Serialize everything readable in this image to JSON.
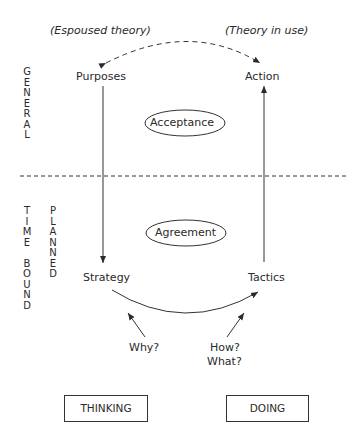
{
  "diagram": {
    "top_labels": {
      "left": "(Espoused theory)",
      "right": "(Theory in use)"
    },
    "nodes": {
      "purposes": "Purposes",
      "action": "Action",
      "strategy": "Strategy",
      "tactics": "Tactics"
    },
    "ellipses": {
      "upper": "Acceptance",
      "lower": "Agreement"
    },
    "questions": {
      "why": "Why?",
      "how": "How?",
      "what": "What?"
    },
    "side_labels": {
      "general": [
        "G",
        "E",
        "N",
        "E",
        "R",
        "A",
        "L"
      ],
      "time_bound": [
        "T",
        "I",
        "M",
        "E",
        " ",
        "B",
        "O",
        "U",
        "N",
        "D"
      ],
      "planned": [
        "P",
        "L",
        "A",
        "N",
        "N",
        "E",
        "D"
      ]
    },
    "boxes": {
      "thinking": "THINKING",
      "doing": "DOING"
    },
    "edges": [
      {
        "from": "purposes",
        "to": "strategy",
        "style": "solid"
      },
      {
        "from": "tactics",
        "to": "action",
        "style": "solid"
      },
      {
        "from": "strategy",
        "to": "tactics",
        "style": "solid-curve"
      },
      {
        "between": [
          "purposes",
          "action"
        ],
        "style": "dashed-curve-bidirectional"
      },
      {
        "from": "why",
        "to": "strategy-tactics-curve",
        "style": "solid"
      },
      {
        "from": "how-what",
        "to": "strategy-tactics-curve",
        "style": "solid"
      }
    ],
    "divider": "dashed-horizontal"
  }
}
